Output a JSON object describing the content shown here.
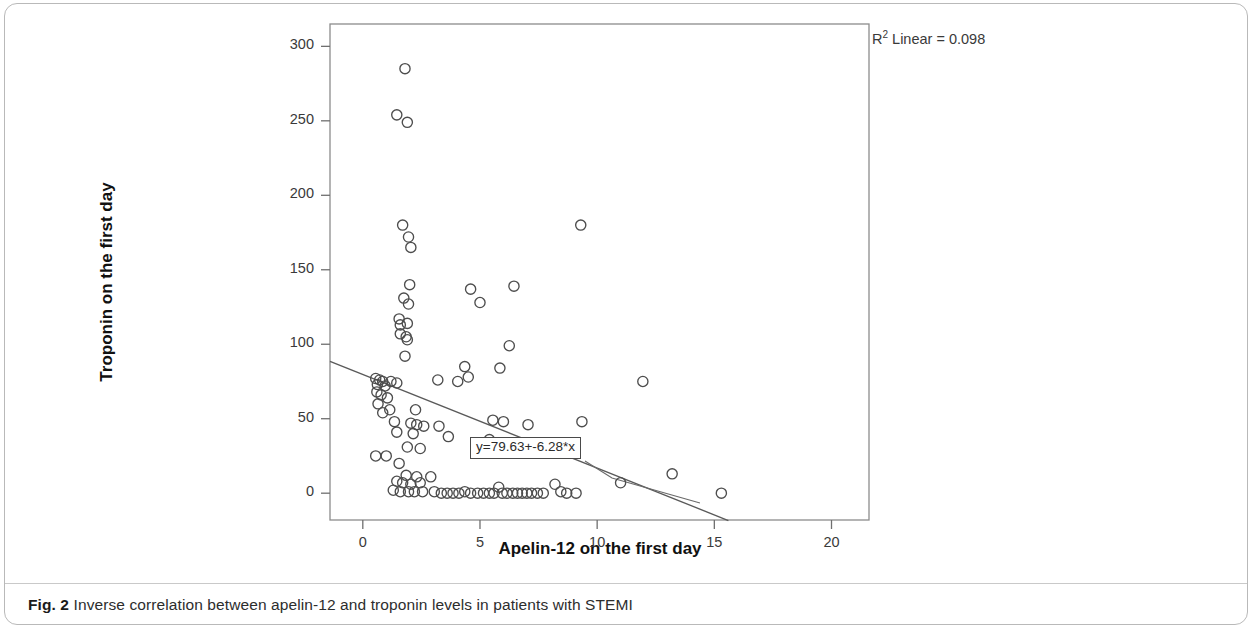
{
  "caption": {
    "figure_label": "Fig. 2",
    "text": "Inverse correlation between apelin-12 and troponin levels in patients with STEMI"
  },
  "annotations": {
    "r2_prefix": "R",
    "r2_sup": "2",
    "r2_text": " Linear = 0.098",
    "equation": "y=79.63+-6.28*x"
  },
  "chart_data": {
    "type": "scatter",
    "title": "",
    "xlabel": "Apelin-12 on the first day",
    "ylabel": "Troponin on the first day",
    "xlim": [
      -1.4,
      21.6
    ],
    "ylim": [
      -18,
      315
    ],
    "xticks": [
      0,
      5,
      10,
      15,
      20
    ],
    "yticks": [
      0,
      50,
      100,
      150,
      200,
      250,
      300
    ],
    "grid": false,
    "legend": null,
    "marker": "open-circle",
    "marker_color": "#4d4d4d",
    "r_squared": 0.098,
    "regression": {
      "intercept": 79.63,
      "slope": -6.28,
      "label": "y=79.63+-6.28*x",
      "line_color": "#5a5a5a",
      "x_start": -1.4,
      "x_end": 15.6
    },
    "points": [
      [
        1.8,
        285
      ],
      [
        1.45,
        254
      ],
      [
        1.9,
        249
      ],
      [
        9.3,
        180
      ],
      [
        1.7,
        180
      ],
      [
        1.95,
        172
      ],
      [
        2.05,
        165
      ],
      [
        2.0,
        140
      ],
      [
        4.6,
        137
      ],
      [
        6.45,
        139
      ],
      [
        1.75,
        131
      ],
      [
        1.95,
        127
      ],
      [
        5.0,
        128
      ],
      [
        1.55,
        117
      ],
      [
        1.6,
        113
      ],
      [
        1.9,
        114
      ],
      [
        1.6,
        107
      ],
      [
        1.85,
        105
      ],
      [
        1.9,
        103
      ],
      [
        6.25,
        99
      ],
      [
        1.8,
        92
      ],
      [
        4.35,
        85
      ],
      [
        5.85,
        84
      ],
      [
        4.5,
        78
      ],
      [
        3.2,
        76
      ],
      [
        4.05,
        75
      ],
      [
        11.95,
        75
      ],
      [
        0.55,
        77
      ],
      [
        0.72,
        76
      ],
      [
        0.85,
        75
      ],
      [
        0.62,
        73
      ],
      [
        0.95,
        72
      ],
      [
        1.2,
        75
      ],
      [
        1.45,
        74
      ],
      [
        0.6,
        68
      ],
      [
        0.78,
        66
      ],
      [
        1.05,
        64
      ],
      [
        0.65,
        60
      ],
      [
        1.15,
        56
      ],
      [
        0.85,
        54
      ],
      [
        2.25,
        56
      ],
      [
        1.35,
        48
      ],
      [
        2.05,
        47
      ],
      [
        2.3,
        46
      ],
      [
        2.6,
        45
      ],
      [
        3.25,
        45
      ],
      [
        5.55,
        49
      ],
      [
        6.0,
        48
      ],
      [
        7.05,
        46
      ],
      [
        9.35,
        48
      ],
      [
        1.45,
        41
      ],
      [
        2.15,
        40
      ],
      [
        3.65,
        38
      ],
      [
        5.4,
        36
      ],
      [
        1.9,
        31
      ],
      [
        2.45,
        30
      ],
      [
        1.0,
        25
      ],
      [
        0.55,
        25
      ],
      [
        1.55,
        20
      ],
      [
        1.85,
        12
      ],
      [
        2.3,
        11
      ],
      [
        1.45,
        8
      ],
      [
        1.7,
        7
      ],
      [
        2.05,
        6
      ],
      [
        2.45,
        7
      ],
      [
        1.3,
        2
      ],
      [
        1.6,
        1
      ],
      [
        1.95,
        1
      ],
      [
        2.2,
        1
      ],
      [
        2.55,
        1
      ],
      [
        2.9,
        11
      ],
      [
        3.05,
        1
      ],
      [
        3.35,
        0
      ],
      [
        3.6,
        0
      ],
      [
        3.85,
        0
      ],
      [
        4.1,
        0
      ],
      [
        4.35,
        1
      ],
      [
        4.6,
        0
      ],
      [
        4.9,
        0
      ],
      [
        5.15,
        0
      ],
      [
        5.4,
        0
      ],
      [
        5.6,
        0
      ],
      [
        5.8,
        4
      ],
      [
        5.95,
        0
      ],
      [
        6.15,
        0
      ],
      [
        6.4,
        0
      ],
      [
        6.6,
        0
      ],
      [
        6.8,
        0
      ],
      [
        7.0,
        0
      ],
      [
        7.2,
        0
      ],
      [
        7.45,
        0
      ],
      [
        7.7,
        0
      ],
      [
        8.2,
        6
      ],
      [
        8.45,
        1
      ],
      [
        8.7,
        0
      ],
      [
        9.1,
        0
      ],
      [
        11.0,
        7
      ],
      [
        13.2,
        13
      ],
      [
        15.3,
        0
      ]
    ]
  }
}
